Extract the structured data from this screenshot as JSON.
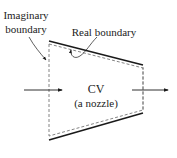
{
  "diagram": {
    "labels": {
      "imaginary_line1": "Imaginary",
      "imaginary_line2": "boundary",
      "real": "Real boundary",
      "cv": "CV",
      "cv_sub": "(a nozzle)"
    },
    "colors": {
      "stroke": "#1a1a1a",
      "dashed": "#777777",
      "text": "#222222",
      "background": "#ffffff"
    },
    "elements": [
      {
        "type": "imaginary-boundary",
        "style": "dashed",
        "position": "inlet"
      },
      {
        "type": "imaginary-boundary",
        "style": "dashed",
        "position": "outlet"
      },
      {
        "type": "real-boundary",
        "style": "solid",
        "position": "top wall"
      },
      {
        "type": "real-boundary",
        "style": "solid",
        "position": "bottom wall"
      },
      {
        "type": "flow-arrow",
        "direction": "right",
        "position": "inlet"
      },
      {
        "type": "flow-arrow",
        "direction": "right",
        "position": "outlet"
      }
    ]
  }
}
